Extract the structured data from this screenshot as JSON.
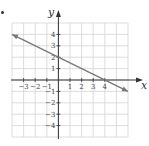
{
  "chart_data": {
    "type": "line",
    "title": "",
    "xlabel": "x",
    "ylabel": "y",
    "xlim": [
      -4,
      6
    ],
    "ylim": [
      -5,
      5
    ],
    "grid": true,
    "x_ticks": [
      -3,
      -2,
      -1,
      1,
      2,
      3,
      4
    ],
    "x_tick_labels": [
      "−3",
      "−2",
      "−1",
      "1",
      "2",
      "3",
      "4"
    ],
    "y_ticks": [
      4,
      3,
      2,
      1,
      -1,
      -2,
      -3,
      -4
    ],
    "y_tick_labels": [
      "4",
      "3",
      "2",
      "1",
      "−1",
      "−2",
      "−3",
      "−4"
    ],
    "series": [
      {
        "name": "line",
        "equation": "y = -1/2 x + 2",
        "points": [
          [
            -4,
            4
          ],
          [
            0,
            2
          ],
          [
            2,
            1
          ],
          [
            4,
            0
          ],
          [
            6,
            -1
          ]
        ],
        "arrows": "both",
        "color": "#777777"
      }
    ]
  },
  "colors": {
    "grid": "#d4d4d4",
    "axis": "#333333",
    "line": "#777777"
  }
}
